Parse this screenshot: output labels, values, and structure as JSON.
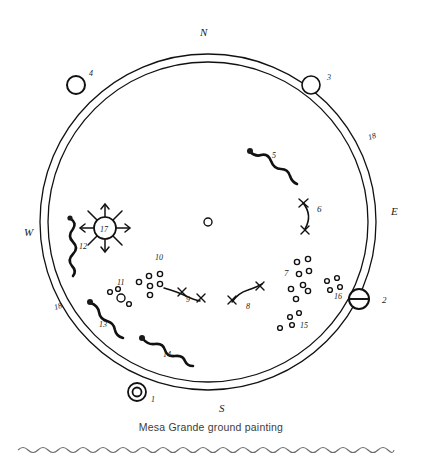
{
  "figure": {
    "caption": "Mesa Grande ground painting",
    "background_color": "#ffffff",
    "ink_color": "#111111",
    "caption_color": "#3b3b3b",
    "rule_color": "#6b6b6b"
  },
  "cardinals": [
    {
      "id": "north",
      "label": "N",
      "x": 200,
      "y": 36
    },
    {
      "id": "east",
      "label": "E",
      "x": 391,
      "y": 215
    },
    {
      "id": "south",
      "label": "S",
      "x": 219,
      "y": 412
    },
    {
      "id": "west",
      "label": "W",
      "x": 24,
      "y": 236
    }
  ],
  "ring": {
    "center_x": 208,
    "center_y": 222,
    "outer_radius": 168,
    "inner_radius": 160,
    "description": "double-line circular band representing the world boundary"
  },
  "center_mark": {
    "label": "center hole",
    "x": 208,
    "y": 222,
    "radius": 4
  },
  "numbered_features": [
    {
      "num": "1",
      "kind": "double-ring",
      "label_x": 151,
      "label_y": 402,
      "cx": 137,
      "cy": 392
    },
    {
      "num": "2",
      "kind": "barred-circle",
      "label_x": 382,
      "label_y": 303,
      "cx": 359,
      "cy": 299
    },
    {
      "num": "3",
      "kind": "open-circle",
      "label_x": 327,
      "label_y": 80,
      "cx": 311,
      "cy": 85
    },
    {
      "num": "4",
      "kind": "open-circle",
      "label_x": 89,
      "label_y": 76,
      "cx": 76,
      "cy": 85
    },
    {
      "num": "5",
      "kind": "snake",
      "label_x": 272,
      "label_y": 158
    },
    {
      "num": "6",
      "kind": "crescent-crosses",
      "label_x": 317,
      "label_y": 212
    },
    {
      "num": "7",
      "kind": "dot-cluster",
      "label_x": 291,
      "label_y": 275,
      "dots": 8
    },
    {
      "num": "8",
      "kind": "curve-crosses",
      "label_x": 246,
      "label_y": 309
    },
    {
      "num": "9",
      "kind": "curve-crosses",
      "label_x": 186,
      "label_y": 302
    },
    {
      "num": "10",
      "kind": "dot-cluster",
      "label_x": 155,
      "label_y": 260,
      "dots": 6
    },
    {
      "num": "11",
      "kind": "dot-cluster",
      "label_x": 117,
      "label_y": 285,
      "dots": 4
    },
    {
      "num": "12",
      "kind": "snake",
      "label_x": 79,
      "label_y": 249
    },
    {
      "num": "13",
      "kind": "snake",
      "label_x": 99,
      "label_y": 327
    },
    {
      "num": "14",
      "kind": "snake",
      "label_x": 163,
      "label_y": 357
    },
    {
      "num": "15",
      "kind": "dot-cluster",
      "label_x": 303,
      "label_y": 325,
      "dots": 4
    },
    {
      "num": "16",
      "kind": "dot-cluster",
      "label_x": 336,
      "label_y": 293,
      "dots": 4
    },
    {
      "num": "17",
      "kind": "sun-rayed-circle",
      "label_x": 105,
      "label_y": 231,
      "cx": 105,
      "cy": 228
    },
    {
      "num": "18",
      "kind": "ring-band",
      "label_x": 369,
      "label_y": 140
    },
    {
      "num": "18",
      "kind": "ring-band",
      "label_x": 55,
      "label_y": 310
    }
  ],
  "bottom_rule": {
    "kind": "wavy-line",
    "y": 450,
    "from_x": 18,
    "to_x": 404
  }
}
